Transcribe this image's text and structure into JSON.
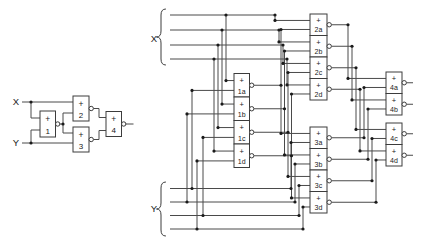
{
  "left_circuit": {
    "input_labels": {
      "x": "X",
      "y": "Y"
    },
    "gates": [
      {
        "sign": "+",
        "label": "1"
      },
      {
        "sign": "+",
        "label": "2"
      },
      {
        "sign": "+",
        "label": "3"
      },
      {
        "sign": "+",
        "label": "4"
      }
    ]
  },
  "right_circuit": {
    "input_labels": {
      "x": "X",
      "y": "Y"
    },
    "gate_columns": [
      {
        "gates": [
          {
            "sign": "+",
            "label": "1a"
          },
          {
            "sign": "+",
            "label": "1b"
          },
          {
            "sign": "+",
            "label": "1c"
          },
          {
            "sign": "+",
            "label": "1d"
          }
        ]
      },
      {
        "gates": [
          {
            "sign": "+",
            "label": "2a"
          },
          {
            "sign": "+",
            "label": "2b"
          },
          {
            "sign": "+",
            "label": "2c"
          },
          {
            "sign": "+",
            "label": "2d"
          }
        ]
      },
      {
        "gates": [
          {
            "sign": "+",
            "label": "3a"
          },
          {
            "sign": "+",
            "label": "3b"
          },
          {
            "sign": "+",
            "label": "3c"
          },
          {
            "sign": "+",
            "label": "3d"
          }
        ]
      },
      {
        "gates": [
          {
            "sign": "+",
            "label": "4a"
          },
          {
            "sign": "+",
            "label": "4b"
          },
          {
            "sign": "+",
            "label": "4c"
          },
          {
            "sign": "+",
            "label": "4d"
          }
        ]
      }
    ]
  },
  "colors": {
    "wire": "#4a4a4a",
    "outline": "#3c3c3c",
    "text": "#1a1a1a",
    "background": "#ffffff"
  }
}
